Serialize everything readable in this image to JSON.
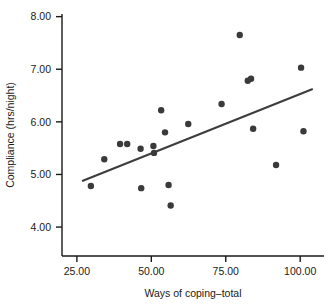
{
  "chart_data": {
    "type": "scatter",
    "title": "",
    "xlabel": "Ways of coping–total",
    "ylabel": "Compliance (hrs/night)",
    "xlim": [
      20,
      108
    ],
    "ylim": [
      3.45,
      8.05
    ],
    "xticks": [
      25,
      50,
      75,
      100
    ],
    "xticklabels": [
      "25.00",
      "50.00",
      "75.00",
      "100.00"
    ],
    "yticks": [
      4.0,
      5.0,
      6.0,
      7.0,
      8.0
    ],
    "yticklabels": [
      "4.00",
      "5.00",
      "6.00",
      "7.00",
      "8.00"
    ],
    "grid": false,
    "legend": false,
    "marker_color": "#3a3a3a",
    "marker_size": 3.2,
    "line_color": "#3d3d3d",
    "axis_color": "#1a1a1a",
    "points": [
      {
        "x": 29.7,
        "y": 4.78
      },
      {
        "x": 34.2,
        "y": 5.29
      },
      {
        "x": 39.5,
        "y": 5.58
      },
      {
        "x": 41.9,
        "y": 5.58
      },
      {
        "x": 46.4,
        "y": 5.49
      },
      {
        "x": 46.6,
        "y": 4.74
      },
      {
        "x": 50.7,
        "y": 5.54
      },
      {
        "x": 50.9,
        "y": 5.41
      },
      {
        "x": 53.3,
        "y": 6.22
      },
      {
        "x": 54.6,
        "y": 5.8
      },
      {
        "x": 55.8,
        "y": 4.8
      },
      {
        "x": 56.5,
        "y": 4.41
      },
      {
        "x": 62.4,
        "y": 5.96
      },
      {
        "x": 73.6,
        "y": 6.34
      },
      {
        "x": 79.7,
        "y": 7.65
      },
      {
        "x": 82.4,
        "y": 6.78
      },
      {
        "x": 83.5,
        "y": 6.82
      },
      {
        "x": 84.2,
        "y": 5.87
      },
      {
        "x": 91.9,
        "y": 5.18
      },
      {
        "x": 100.3,
        "y": 7.03
      },
      {
        "x": 101.1,
        "y": 5.82
      }
    ],
    "fit_line": {
      "name": "linear fit",
      "x0": 27.0,
      "y0": 4.88,
      "x1": 104.0,
      "y1": 6.62
    }
  }
}
